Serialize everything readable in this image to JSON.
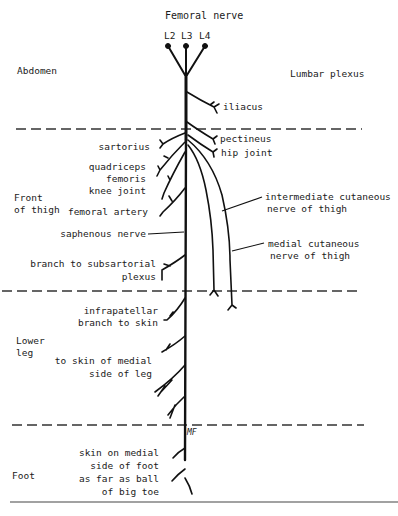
{
  "title": "Femoral nerve",
  "roots": [
    "L2",
    "L3",
    "L4"
  ],
  "regions": [
    {
      "name": "Abdomen"
    },
    {
      "name": "Front of thigh",
      "lines": [
        "Front",
        "of thigh"
      ]
    },
    {
      "name": "Lower leg",
      "lines": [
        "Lower",
        "leg"
      ]
    },
    {
      "name": "Foot"
    }
  ],
  "origin_label": "Lumbar plexus",
  "branches": {
    "iliacus": "iliacus",
    "pectineus": "pectineus",
    "hip_joint": "hip joint",
    "sartorius": "sartorius",
    "quadriceps": [
      "quadriceps",
      "femoris"
    ],
    "knee_joint": "knee joint",
    "femoral_artery": "femoral artery",
    "saphenous": "saphenous nerve",
    "subsartorial": [
      "branch to subsartorial",
      "plexus"
    ],
    "intermediate_cutaneous": [
      "intermediate cutaneous",
      "nerve of thigh"
    ],
    "medial_cutaneous": [
      "medial cutaneous",
      "nerve of thigh"
    ],
    "infrapatellar": [
      "infrapatellar",
      "branch to skin"
    ],
    "medial_leg": [
      "to skin of medial",
      "side of leg"
    ],
    "foot": [
      "skin on medial",
      "side of foot",
      "as far as ball",
      "of big toe"
    ]
  },
  "signature": "MF",
  "colors": {
    "line": "#111111",
    "dash": "#333333",
    "background": "#ffffff"
  }
}
